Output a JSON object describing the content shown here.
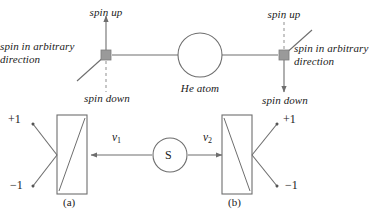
{
  "figure": {
    "colors": {
      "stroke": "#6e6e6e",
      "stroke_dark": "#555555",
      "node_fill": "#9a9a9a",
      "text": "#1a1a1a",
      "background": "#ffffff"
    }
  },
  "top_panel": {
    "left_detector": {
      "spin_up_label": "spin up",
      "spin_down_label": "spin down",
      "arbitrary_label_line1": "spin in arbitrary",
      "arbitrary_label_line2": "direction",
      "up_axis_style": "solid-arrow",
      "down_axis_style": "dashed"
    },
    "right_detector": {
      "spin_up_label": "spin up",
      "spin_down_label": "spin down",
      "arbitrary_label_line1": "spin in arbitrary",
      "arbitrary_label_line2": "direction",
      "up_axis_style": "dashed",
      "down_axis_style": "solid-arrow"
    },
    "center_particle_label": "He atom"
  },
  "bottom_panel": {
    "source_label": "S",
    "left_velocity_label": "v",
    "left_velocity_sub": "1",
    "right_velocity_label": "v",
    "right_velocity_sub": "2",
    "left_analyzer_caption": "(a)",
    "right_analyzer_caption": "(b)",
    "left_outcomes": {
      "plus": "+1",
      "minus": "−1"
    },
    "right_outcomes": {
      "plus": "+1",
      "minus": "−1"
    }
  }
}
